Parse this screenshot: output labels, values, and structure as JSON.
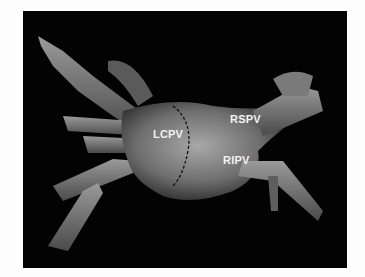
{
  "figure": {
    "labels": {
      "lcpv": "LCPV",
      "rspv": "RSPV",
      "ripv": "RIPV"
    },
    "colors": {
      "background": "#030303",
      "label": "#f2f2f2",
      "page": "#fdfdfd"
    }
  }
}
